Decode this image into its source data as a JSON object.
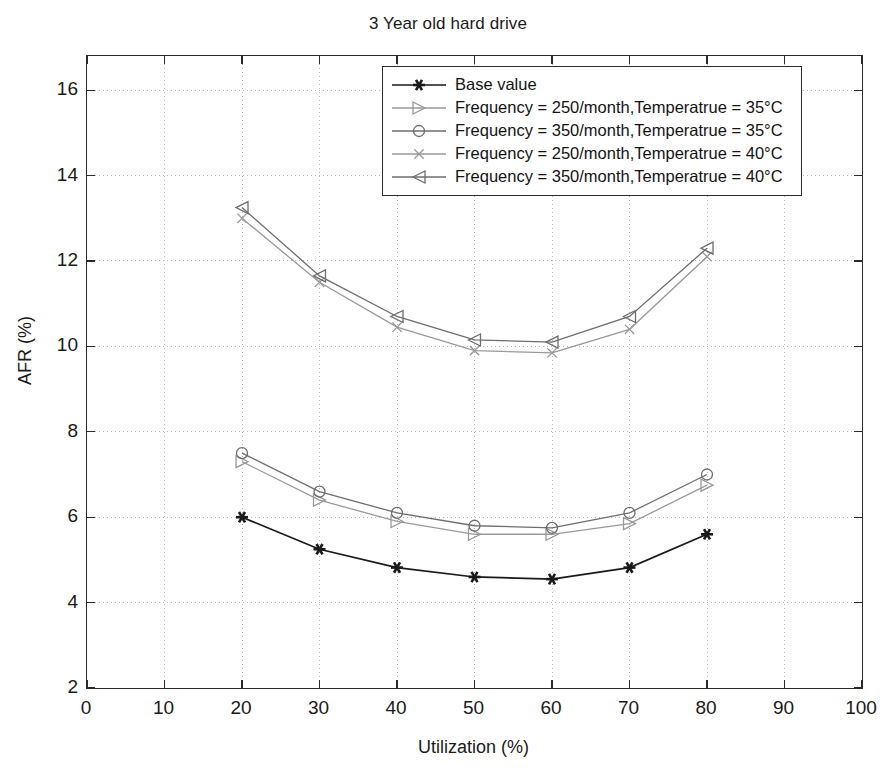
{
  "chart_data": {
    "type": "line",
    "title": "3 Year old hard drive",
    "xlabel": "Utilization (%)",
    "ylabel": "AFR (%)",
    "xlim": [
      0,
      100
    ],
    "ylim": [
      2,
      16.8
    ],
    "xticks": [
      0,
      10,
      20,
      30,
      40,
      50,
      60,
      70,
      80,
      90,
      100
    ],
    "yticks": [
      2,
      4,
      6,
      8,
      10,
      12,
      14,
      16
    ],
    "grid": true,
    "legend_position": "top-center",
    "x": [
      20,
      30,
      40,
      50,
      60,
      70,
      80
    ],
    "series": [
      {
        "name": "Base value",
        "marker": "asterisk",
        "color": "#1a1a1a",
        "values": [
          6.0,
          5.25,
          4.82,
          4.6,
          4.55,
          4.82,
          5.6
        ]
      },
      {
        "name": "Frequency = 250/month,Temperatrue = 35°C",
        "marker": "triangle-right",
        "color": "#9a9a9a",
        "values": [
          7.3,
          6.4,
          5.9,
          5.6,
          5.6,
          5.85,
          6.75
        ]
      },
      {
        "name": "Frequency = 350/month,Temperatrue = 35°C",
        "marker": "circle",
        "color": "#6e6e6e",
        "values": [
          7.5,
          6.6,
          6.1,
          5.8,
          5.75,
          6.1,
          7.0
        ]
      },
      {
        "name": "Frequency = 250/month,Temperatrue = 40°C",
        "marker": "x-mark",
        "color": "#9a9a9a",
        "values": [
          13.0,
          11.5,
          10.45,
          9.9,
          9.85,
          10.4,
          12.1
        ]
      },
      {
        "name": "Frequency = 350/month,Temperatrue = 40°C",
        "marker": "triangle-left",
        "color": "#6e6e6e",
        "values": [
          13.25,
          11.65,
          10.7,
          10.15,
          10.1,
          10.7,
          12.3
        ]
      }
    ]
  },
  "axes": {
    "ytick_labels": [
      "16",
      "14",
      "12",
      "10",
      "8",
      "6",
      "4",
      "2"
    ],
    "xtick_labels": [
      "0",
      "10",
      "20",
      "30",
      "40",
      "50",
      "60",
      "70",
      "80",
      "90",
      "100"
    ]
  },
  "legend": {
    "items": [
      {
        "label": "Base value",
        "marker": "asterisk-icon"
      },
      {
        "label": "Frequency = 250/month,Temperatrue = 35°C",
        "marker": "triangle-right-icon"
      },
      {
        "label": "Frequency = 350/month,Temperatrue = 35°C",
        "marker": "circle-icon"
      },
      {
        "label": "Frequency = 250/month,Temperatrue = 40°C",
        "marker": "x-mark-icon"
      },
      {
        "label": "Frequency = 350/month,Temperatrue = 40°C",
        "marker": "triangle-left-icon"
      }
    ]
  },
  "colors": {
    "axis": "#2a2a2a",
    "grid": "#b8b8b8",
    "base_series": "#1a1a1a",
    "light_series": "#9a9a9a",
    "mid_series": "#6e6e6e",
    "background": "#ffffff"
  }
}
